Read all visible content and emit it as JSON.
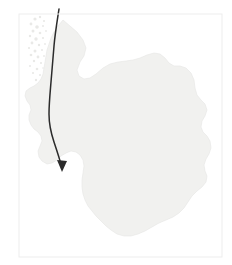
{
  "figure": {
    "kind": "map-figure",
    "background_color": "#ffffff",
    "width": 232,
    "height": 265
  },
  "frame": {
    "name": "map-border-frame",
    "x": 19,
    "y": 14,
    "width": 203,
    "height": 243,
    "stroke_color": "#ededed",
    "stroke_width": 1,
    "fill": "none"
  },
  "landmass": {
    "name": "landmass-polygon",
    "fill_color": "#f1f1ef",
    "stroke_color": "#e6e6e4",
    "stroke_width": 0.6,
    "label": "",
    "path": "M 63 20 L 70 26 L 77 32 L 83 40 L 86 48 L 84 56 L 80 62 L 77 70 L 79 76 L 84 79 L 90 78 L 96 74 L 103 68 L 110 64 L 118 62 L 126 61 L 133 60 L 140 58 L 147 55 L 154 53 L 160 54 L 165 58 L 169 63 L 174 66 L 180 66 L 186 68 L 191 73 L 194 80 L 195 88 L 197 95 L 201 100 L 205 104 L 207 110 L 205 116 L 202 121 L 201 127 L 203 132 L 207 136 L 210 141 L 211 148 L 209 154 L 206 159 L 204 165 L 205 171 L 207 176 L 206 182 L 202 187 L 197 191 L 192 196 L 188 202 L 184 208 L 179 213 L 173 217 L 166 220 L 159 223 L 152 227 L 145 231 L 138 234 L 131 236 L 124 236 L 117 234 L 111 230 L 106 226 L 101 221 L 96 216 L 92 211 L 88 206 L 85 200 L 83 194 L 82 187 L 82 180 L 83 173 L 84 166 L 83 160 L 80 155 L 76 152 L 71 151 L 66 153 L 61 156 L 57 160 L 52 163 L 47 164 L 42 161 L 39 157 L 38 151 L 40 146 L 42 141 L 41 136 L 38 132 L 34 129 L 31 125 L 29 120 L 29 115 L 31 110 L 30 105 L 27 101 L 25 96 L 26 91 L 30 88 L 34 86 L 38 83 L 41 79 L 43 74 L 44 68 L 45 62 L 46 56 L 47 50 L 49 44 L 51 38 L 54 32 L 58 26 Z"
  },
  "coastal_islands": {
    "name": "coastal-speckle-group",
    "fill_color": "#e9e9e7",
    "description": "faint speckled island fragments along north-west coast",
    "dots": [
      {
        "cx": 35,
        "cy": 19,
        "r": 1.6
      },
      {
        "cx": 40,
        "cy": 17,
        "r": 1.2
      },
      {
        "cx": 44,
        "cy": 21,
        "r": 1.1
      },
      {
        "cx": 31,
        "cy": 24,
        "r": 1.4
      },
      {
        "cx": 37,
        "cy": 27,
        "r": 1.8
      },
      {
        "cx": 43,
        "cy": 26,
        "r": 1.0
      },
      {
        "cx": 33,
        "cy": 31,
        "r": 1.5
      },
      {
        "cx": 40,
        "cy": 33,
        "r": 1.3
      },
      {
        "cx": 46,
        "cy": 31,
        "r": 0.9
      },
      {
        "cx": 30,
        "cy": 36,
        "r": 1.2
      },
      {
        "cx": 36,
        "cy": 39,
        "r": 1.7
      },
      {
        "cx": 43,
        "cy": 38,
        "r": 1.1
      },
      {
        "cx": 32,
        "cy": 43,
        "r": 1.4
      },
      {
        "cx": 39,
        "cy": 45,
        "r": 1.2
      },
      {
        "cx": 45,
        "cy": 44,
        "r": 0.9
      },
      {
        "cx": 29,
        "cy": 48,
        "r": 1.1
      },
      {
        "cx": 35,
        "cy": 51,
        "r": 1.5
      },
      {
        "cx": 42,
        "cy": 50,
        "r": 1.0
      },
      {
        "cx": 31,
        "cy": 55,
        "r": 1.3
      },
      {
        "cx": 38,
        "cy": 57,
        "r": 1.4
      },
      {
        "cx": 44,
        "cy": 56,
        "r": 0.9
      },
      {
        "cx": 34,
        "cy": 61,
        "r": 1.2
      },
      {
        "cx": 41,
        "cy": 63,
        "r": 1.1
      },
      {
        "cx": 30,
        "cy": 66,
        "r": 1.0
      },
      {
        "cx": 37,
        "cy": 69,
        "r": 1.3
      },
      {
        "cx": 43,
        "cy": 68,
        "r": 0.8
      },
      {
        "cx": 33,
        "cy": 73,
        "r": 1.1
      },
      {
        "cx": 40,
        "cy": 75,
        "r": 1.0
      },
      {
        "cx": 36,
        "cy": 80,
        "r": 1.2
      },
      {
        "cx": 42,
        "cy": 82,
        "r": 0.9
      }
    ]
  },
  "route": {
    "name": "route-arrow-path",
    "stroke_color": "#2b2b2b",
    "stroke_width": 1.5,
    "label": "",
    "start": {
      "x": 59,
      "y": 9
    },
    "end": {
      "x": 62,
      "y": 171
    },
    "path": "M 59 9 C 57 22, 55 34, 54 46 C 53 58, 52 70, 51 82 C 50 94, 49 104, 49 114 C 49 124, 51 133, 54 142 C 57 151, 60 160, 62 168",
    "arrowhead": {
      "name": "arrowhead",
      "tip": {
        "x": 62,
        "y": 172
      },
      "points": "62,172 57,160 67,161",
      "fill_color": "#2b2b2b"
    }
  }
}
